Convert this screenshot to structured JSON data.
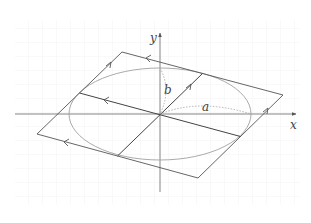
{
  "diagram": {
    "axes": {
      "x_label": "x",
      "y_label": "y"
    },
    "labels": {
      "semi_major": "a",
      "semi_minor": "b"
    },
    "colors": {
      "line": "#555555",
      "ellipse": "#9a9a9a",
      "dotted": "#aaaaaa",
      "grid": "#f3f3f3"
    },
    "geometry": {
      "origin": [
        160,
        114
      ],
      "ellipse_rx": 91,
      "ellipse_ry": 46,
      "parallelogram": [
        [
          122,
          52
        ],
        [
          283,
          95
        ],
        [
          198,
          178
        ],
        [
          37,
          134
        ]
      ]
    }
  }
}
